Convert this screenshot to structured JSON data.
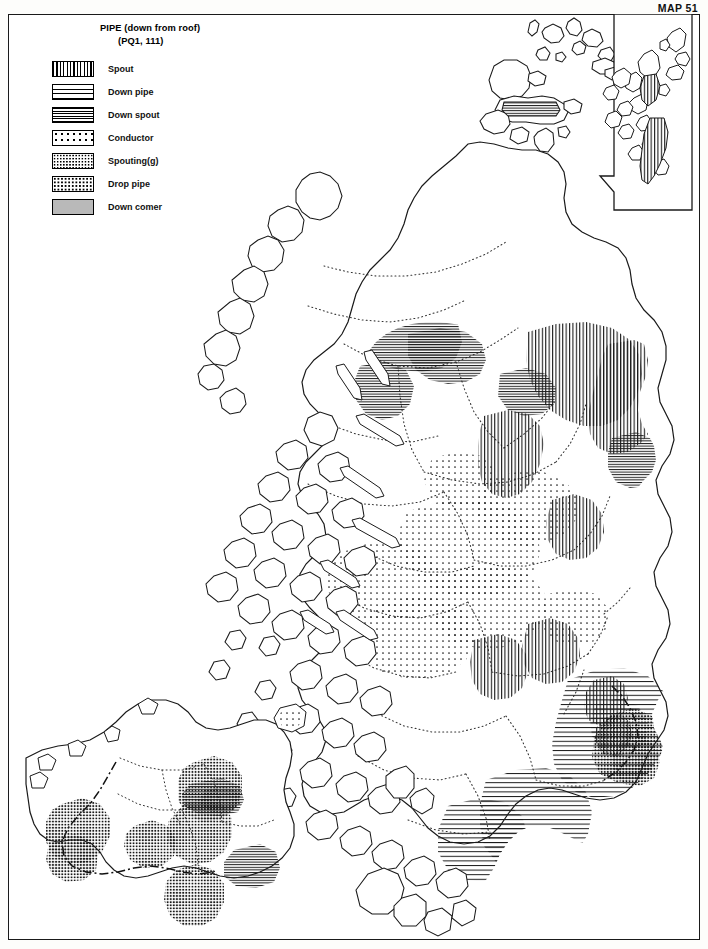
{
  "header": {
    "map_number": "MAP 51"
  },
  "legend": {
    "title_line1": "PIPE (down from roof)",
    "title_line2": "(PQ1, 111)",
    "items": [
      {
        "label": "Spout",
        "pattern": "vertical-lines",
        "swatch": "p-spout"
      },
      {
        "label": "Down pipe",
        "pattern": "horizontal-lines-wide",
        "swatch": "p-downpipe"
      },
      {
        "label": "Down spout",
        "pattern": "horizontal-lines-tight",
        "swatch": "p-downspout"
      },
      {
        "label": "Conductor",
        "pattern": "sparse-dots",
        "swatch": "p-conductor"
      },
      {
        "label": "Spouting(g)",
        "pattern": "dense-dot-mesh",
        "swatch": "p-spouting"
      },
      {
        "label": "Drop pipe",
        "pattern": "medium-dots",
        "swatch": "p-droppipe"
      },
      {
        "label": "Down comer",
        "pattern": "solid-grey",
        "swatch": "p-downcomer"
      }
    ]
  },
  "map": {
    "region_name": "Scotland",
    "insets": [
      {
        "name": "shetland-inset",
        "position": "top-right"
      },
      {
        "name": "northern-ireland-inset",
        "position": "bottom-left"
      }
    ],
    "boundaries": {
      "coastline": "solid",
      "county": "dotted",
      "national": "dash-dot"
    }
  },
  "colors": {
    "ink": "#1a1a1a",
    "paper": "#ffffff",
    "grey_fill": "#b9b9b9"
  }
}
